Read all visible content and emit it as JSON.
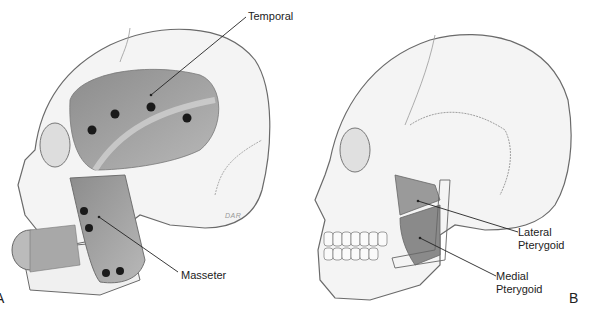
{
  "figure": {
    "panel_a": {
      "letter": "A",
      "signature": "DAR",
      "labels": [
        {
          "id": "temporal",
          "text": "Temporal"
        },
        {
          "id": "masseter",
          "text": "Masseter"
        }
      ],
      "colors": {
        "bone": "#f4f4f4",
        "outline": "#6a6a6a",
        "muscle": "#9a9a9a",
        "dot": "#1a1a1a"
      }
    },
    "panel_b": {
      "letter": "B",
      "labels": [
        {
          "id": "lateral-pterygoid",
          "line1": "Lateral",
          "line2": "Pterygoid"
        },
        {
          "id": "medial-pterygoid",
          "line1": "Medial",
          "line2": "Pterygoid"
        }
      ]
    }
  }
}
